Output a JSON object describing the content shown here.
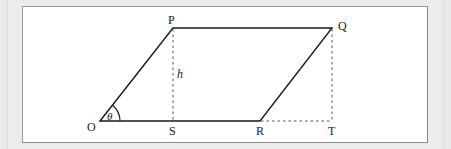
{
  "figure": {
    "type": "parallelogram",
    "vertices": {
      "O": {
        "label": "O"
      },
      "P": {
        "label": "P"
      },
      "Q": {
        "label": "Q"
      },
      "R": {
        "label": "R"
      }
    },
    "foot_points": {
      "S": {
        "label": "S"
      },
      "T": {
        "label": "T"
      }
    },
    "height_label": "h",
    "angle_label": "θ",
    "colors": {
      "stroke": "#1a1a1a",
      "dashed": "#555555",
      "panel_bg": "#ffffff",
      "frame_bg": "#ececec"
    }
  }
}
